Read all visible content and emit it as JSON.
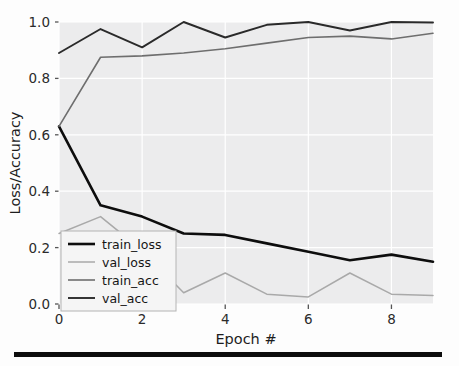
{
  "figure": {
    "background_color": "#fdfdfd",
    "plot_background_color": "#ececed",
    "grid_color": "#ffffff",
    "bottom_rule_color": "#0d0d0d"
  },
  "axes": {
    "ylabel": "Loss/Accuracy",
    "xlabel": "Epoch #",
    "ytick_labels": [
      "0.0",
      "0.2",
      "0.4",
      "0.6",
      "0.8",
      "1.0"
    ],
    "xtick_labels": [
      "0",
      "2",
      "4",
      "6",
      "8"
    ]
  },
  "legend": {
    "entries": [
      {
        "label": "train_loss",
        "color": "#0d0d0d",
        "width": 2.6
      },
      {
        "label": "val_loss",
        "color": "#a9a9a9",
        "width": 1.5
      },
      {
        "label": "train_acc",
        "color": "#6e6e6e",
        "width": 1.6
      },
      {
        "label": "val_acc",
        "color": "#2a2a2a",
        "width": 1.9
      }
    ],
    "border_color": "#b4b4b4",
    "background_color": "#f5f5f5"
  },
  "chart_data": {
    "type": "line",
    "title": "",
    "xlabel": "Epoch #",
    "ylabel": "Loss/Accuracy",
    "x": [
      0,
      1,
      2,
      3,
      4,
      5,
      6,
      7,
      8,
      9
    ],
    "xlim": [
      0,
      9
    ],
    "ylim": [
      0.0,
      1.0
    ],
    "xticks": [
      0,
      2,
      4,
      6,
      8
    ],
    "yticks": [
      0.0,
      0.2,
      0.4,
      0.6,
      0.8,
      1.0
    ],
    "grid": true,
    "legend_position": "lower left",
    "series": [
      {
        "name": "train_loss",
        "color": "#0d0d0d",
        "values": [
          0.63,
          0.35,
          0.31,
          0.25,
          0.245,
          0.215,
          0.185,
          0.155,
          0.175,
          0.15
        ]
      },
      {
        "name": "val_loss",
        "color": "#a9a9a9",
        "values": [
          0.25,
          0.31,
          0.19,
          0.04,
          0.11,
          0.035,
          0.025,
          0.11,
          0.035,
          0.03
        ]
      },
      {
        "name": "train_acc",
        "color": "#6e6e6e",
        "values": [
          0.63,
          0.875,
          0.88,
          0.89,
          0.905,
          0.925,
          0.945,
          0.95,
          0.94,
          0.96
        ]
      },
      {
        "name": "val_acc",
        "color": "#2a2a2a",
        "values": [
          0.89,
          0.975,
          0.91,
          1.0,
          0.945,
          0.99,
          1.0,
          0.97,
          1.0,
          0.998
        ]
      }
    ]
  }
}
